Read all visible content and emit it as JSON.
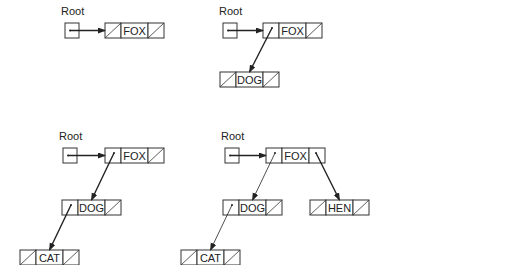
{
  "diagram": {
    "root_label": "Root",
    "panels": [
      {
        "id": "panel-1",
        "root": {
          "x": 65,
          "y": 23
        },
        "label": {
          "x": 61,
          "y": 15
        },
        "nodes": [
          {
            "id": "fox",
            "value": "FOX",
            "x": 105,
            "y": 23,
            "left": null,
            "right": null
          }
        ],
        "edges": [
          {
            "from": "root",
            "to": "fox",
            "weight": "bold"
          }
        ]
      },
      {
        "id": "panel-2",
        "root": {
          "x": 223,
          "y": 23
        },
        "label": {
          "x": 219,
          "y": 15
        },
        "nodes": [
          {
            "id": "fox",
            "value": "FOX",
            "x": 263,
            "y": 23,
            "left": "dog",
            "right": null
          },
          {
            "id": "dog",
            "value": "DOG",
            "x": 220,
            "y": 72,
            "left": null,
            "right": null
          }
        ],
        "edges": [
          {
            "from": "root",
            "to": "fox",
            "weight": "bold"
          },
          {
            "from": "fox",
            "to": "dog",
            "weight": "bold"
          }
        ]
      },
      {
        "id": "panel-3",
        "root": {
          "x": 63,
          "y": 148
        },
        "label": {
          "x": 59,
          "y": 140
        },
        "nodes": [
          {
            "id": "fox",
            "value": "FOX",
            "x": 105,
            "y": 148,
            "left": "dog",
            "right": null
          },
          {
            "id": "dog",
            "value": "DOG",
            "x": 62,
            "y": 200,
            "left": "cat",
            "right": null
          },
          {
            "id": "cat",
            "value": "CAT",
            "x": 20,
            "y": 250,
            "left": null,
            "right": null
          }
        ],
        "edges": [
          {
            "from": "root",
            "to": "fox",
            "weight": "bold"
          },
          {
            "from": "fox",
            "to": "dog",
            "weight": "bold"
          },
          {
            "from": "dog",
            "to": "cat",
            "weight": "bold"
          }
        ]
      },
      {
        "id": "panel-4",
        "root": {
          "x": 225,
          "y": 148
        },
        "label": {
          "x": 221,
          "y": 140
        },
        "nodes": [
          {
            "id": "fox",
            "value": "FOX",
            "x": 266,
            "y": 148,
            "left": "dog",
            "right": "hen"
          },
          {
            "id": "dog",
            "value": "DOG",
            "x": 223,
            "y": 200,
            "left": "cat",
            "right": null
          },
          {
            "id": "hen",
            "value": "HEN",
            "x": 310,
            "y": 200,
            "left": null,
            "right": null
          },
          {
            "id": "cat",
            "value": "CAT",
            "x": 181,
            "y": 250,
            "left": null,
            "right": null
          }
        ],
        "edges": [
          {
            "from": "root",
            "to": "fox",
            "weight": "bold"
          },
          {
            "from": "fox",
            "to": "dog",
            "weight": "thin"
          },
          {
            "from": "dog",
            "to": "cat",
            "weight": "thin"
          },
          {
            "from": "fox",
            "to": "hen",
            "weight": "bold"
          }
        ]
      }
    ]
  }
}
